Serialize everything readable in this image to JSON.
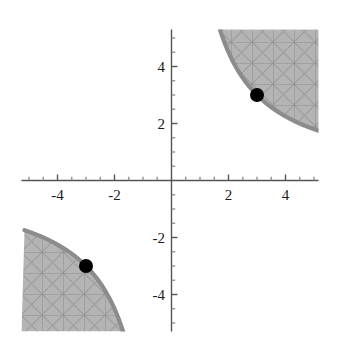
{
  "chart_data": {
    "type": "area",
    "title": "",
    "subtitle": "",
    "xlabel": "",
    "ylabel": "",
    "xlim": [
      -5.25,
      5.25
    ],
    "ylim": [
      -5.25,
      5.25
    ],
    "grid": false,
    "legend": null,
    "axes": {
      "style": "cross-at-origin",
      "x_ticks_major": [
        -4,
        -2,
        2,
        4
      ],
      "x_ticks_minor": [
        -5,
        -4.5,
        -3.5,
        -3,
        -2.5,
        -1.5,
        -1,
        -0.5,
        0.5,
        1,
        1.5,
        2.5,
        3,
        3.5,
        4.5,
        5
      ],
      "y_ticks_major": [
        -4,
        -2,
        2,
        4
      ],
      "y_ticks_minor": [
        -5,
        -4.5,
        -3.5,
        -3,
        -2.5,
        -1.5,
        -1,
        -0.5,
        0.5,
        1,
        1.5,
        2.5,
        3,
        3.5,
        4.5,
        5
      ],
      "x_tick_labels": [
        "-4",
        "-2",
        "2",
        "4"
      ],
      "y_tick_labels": [
        "-4",
        "-2",
        "2",
        "4"
      ]
    },
    "regions": [
      {
        "name": "upper-right-region",
        "inequality": "x*y >= 9",
        "quadrant": "I",
        "fill_color": "#b3b3b3",
        "fill_pattern": "crosshatch-mesh",
        "boundary_color": "#8c8c8c",
        "boundary_width": 4,
        "boundary_curve": "xy = 9"
      },
      {
        "name": "lower-left-region",
        "inequality": "x*y >= 9",
        "quadrant": "III",
        "fill_color": "#b3b3b3",
        "fill_pattern": "crosshatch-mesh",
        "boundary_color": "#8c8c8c",
        "boundary_width": 4,
        "boundary_curve": "xy = 9"
      }
    ],
    "points": [
      {
        "name": "point-upper-right",
        "x": 3,
        "y": 3,
        "color": "#000000",
        "radius": 7
      },
      {
        "name": "point-lower-left",
        "x": -3,
        "y": -3,
        "color": "#000000",
        "radius": 7
      }
    ],
    "hyperbola_constant": 9,
    "colors": {
      "background": "#ffffff",
      "axis": "#555555",
      "region_fill": "#b3b3b3",
      "region_edge": "#8c8c8c",
      "hatch_line": "#9a9a9a",
      "point": "#000000",
      "tick_text": "#1a1a1a"
    }
  }
}
